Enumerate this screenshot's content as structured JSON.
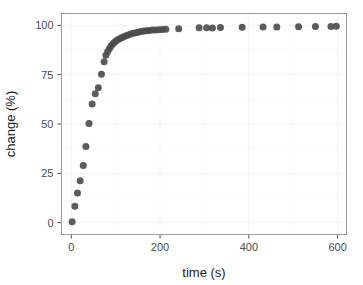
{
  "chart_data": {
    "type": "scatter",
    "title": "",
    "xlabel": "time (s)",
    "ylabel": "change (%)",
    "xlim": [
      -22,
      620
    ],
    "ylim": [
      -6,
      106
    ],
    "xticks": [
      0,
      200,
      400,
      600
    ],
    "yticks": [
      0,
      25,
      50,
      75,
      100
    ],
    "xtick_labels": [
      "0",
      "200",
      "400",
      "600"
    ],
    "ytick_labels": [
      "0",
      "25",
      "50",
      "75",
      "100"
    ],
    "x_minor_ticks": [
      100,
      300,
      500
    ],
    "y_minor_ticks": [
      12.5,
      37.5,
      62.5,
      87.5
    ],
    "grid": true,
    "legend": "none",
    "marker": {
      "shape": "circle",
      "color": "#4d4d4d",
      "size": 7,
      "opacity": 0.92
    },
    "series": [
      {
        "name": "change",
        "x": [
          2,
          8,
          14,
          20,
          27,
          33,
          40,
          47,
          54,
          61,
          68,
          74,
          78,
          82,
          86,
          90,
          94,
          98,
          102,
          107,
          112,
          117,
          122,
          128,
          134,
          140,
          146,
          152,
          158,
          164,
          170,
          176,
          183,
          190,
          197,
          205,
          213,
          242,
          288,
          305,
          318,
          336,
          385,
          432,
          463,
          512,
          550,
          585,
          597
        ],
        "y": [
          0.5,
          8.3,
          15.0,
          21.2,
          29.0,
          38.6,
          50.2,
          60.1,
          65.3,
          68.4,
          75.2,
          81.6,
          84.8,
          86.8,
          88.3,
          89.6,
          90.7,
          91.6,
          92.3,
          93.0,
          93.6,
          94.1,
          94.6,
          95.1,
          95.6,
          96.0,
          96.3,
          96.6,
          96.9,
          97.1,
          97.3,
          97.4,
          97.6,
          97.7,
          97.8,
          97.9,
          98.0,
          98.3,
          98.8,
          98.8,
          98.7,
          98.9,
          99.0,
          99.1,
          99.2,
          99.3,
          99.4,
          99.4,
          99.5
        ]
      }
    ]
  },
  "figure": {
    "background_color": "#ffffff",
    "panel_border_color": "#9c9c9c",
    "grid_color": "#f2f2f2",
    "tick_label_color": "#4d4d4d",
    "axis_title_color": "#1a1a1a"
  }
}
